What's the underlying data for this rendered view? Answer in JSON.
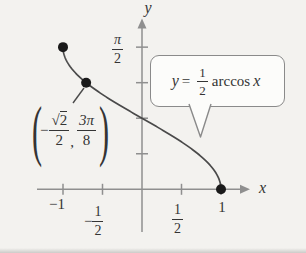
{
  "colors": {
    "background": "#f3f2ef",
    "axis": "#8f8f8f",
    "curve": "#4a4a4a",
    "point": "#1a1a1a",
    "text": "#343434",
    "callout_border": "#8a8a8a",
    "callout_fill": "#fcfcfa"
  },
  "axes": {
    "x_label": "x",
    "y_label": "y"
  },
  "tick_labels": {
    "pi_over_2": {
      "num": "π",
      "den": "2"
    },
    "neg_one": "−1",
    "neg_one_half": {
      "sign": "−",
      "num": "1",
      "den": "2"
    },
    "one_half": {
      "num": "1",
      "den": "2"
    },
    "one": "1"
  },
  "point_label": {
    "open_paren": "(",
    "sign": "−",
    "sqrt_sign": "√",
    "radicand": "2",
    "den1": "2",
    "comma": ",",
    "num2": "3π",
    "den2": "8",
    "close_paren": ")"
  },
  "callout": {
    "lhs": "y",
    "equals": "=",
    "frac_num": "1",
    "frac_den": "2",
    "function_name": "arccos",
    "variable": "x"
  },
  "chart_data": {
    "type": "line",
    "title": "",
    "equation": "y = (1/2) arccos x",
    "function": {
      "form": "y = a·arccos(x)",
      "a": 0.5
    },
    "domain": [
      -1,
      1
    ],
    "range": [
      0,
      1.5708
    ],
    "x_ticks": [
      -1,
      -0.5,
      0.5,
      1
    ],
    "y_ticks_radians": [
      0.3927,
      0.7854,
      1.1781,
      1.5708
    ],
    "y_tick_display": [
      "",
      "",
      "",
      "π/2"
    ],
    "marked_points": [
      {
        "x": -1,
        "y": 1.5708,
        "label": ""
      },
      {
        "x": -0.7071,
        "y": 1.1781,
        "label": "(−√2/2, 3π/8)"
      },
      {
        "x": 1,
        "y": 0,
        "label": ""
      }
    ],
    "grid": false,
    "legend_position": "none"
  }
}
